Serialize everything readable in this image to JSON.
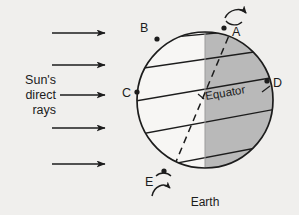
{
  "diagram": {
    "background_color": "#f0efed",
    "ink_color": "#1c1c1c",
    "night_shade_color": "#b9b9b9",
    "earth_caption": "Earth",
    "equator_label": "Equator",
    "sun_label_lines": [
      "Sun's",
      "direct",
      "rays"
    ],
    "point_labels": [
      {
        "id": "A",
        "label": "A",
        "x": 234,
        "y": 30,
        "dot_x": 224,
        "dot_y": 28
      },
      {
        "id": "B",
        "label": "B",
        "x": 140,
        "y": 32,
        "dot_x": 157,
        "dot_y": 39
      },
      {
        "id": "C",
        "label": "C",
        "x": 125,
        "y": 96,
        "dot_x": 137,
        "dot_y": 92
      },
      {
        "id": "D",
        "label": "D",
        "x": 274,
        "y": 85,
        "dot_x": 267,
        "dot_y": 81
      },
      {
        "id": "E",
        "label": "E",
        "x": 148,
        "y": 182,
        "dot_x": 164,
        "dot_y": 171
      }
    ],
    "ray_arrows": [
      {
        "y": 33,
        "x1": 52,
        "x2": 104
      },
      {
        "y": 65,
        "x1": 52,
        "x2": 104
      },
      {
        "y": 95,
        "x1": 58,
        "x2": 104
      },
      {
        "y": 128,
        "x1": 52,
        "x2": 104
      },
      {
        "y": 164,
        "x1": 52,
        "x2": 104
      }
    ],
    "earth": {
      "cx": 205,
      "cy": 100,
      "r": 68
    },
    "terminator_x": 205,
    "rotation_arrows": [
      {
        "id": "north-rotation",
        "label": "rotation-arrow-north"
      },
      {
        "id": "south-rotation",
        "label": "rotation-arrow-south"
      }
    ],
    "latitude_lines": [
      {
        "id": "lat-1",
        "y_left": 39,
        "y_right": 28
      },
      {
        "id": "lat-2",
        "y_left": 66,
        "y_right": 50
      },
      {
        "id": "lat-3-equator",
        "y_left": 98,
        "y_right": 78
      },
      {
        "id": "lat-4",
        "y_left": 131,
        "y_right": 110
      },
      {
        "id": "lat-5",
        "y_left": 168,
        "y_right": 145
      }
    ]
  }
}
